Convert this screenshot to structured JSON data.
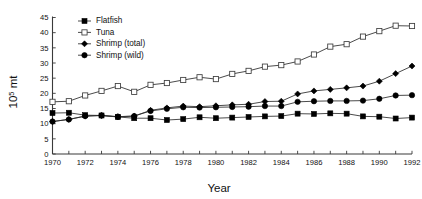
{
  "chart_data": {
    "type": "line",
    "title": "",
    "xlabel": "Year",
    "ylabel": "10^5 mt",
    "ylabel_base": "10",
    "ylabel_sup": "5",
    "ylabel_unit": " mt",
    "xlim": [
      1970,
      1992
    ],
    "ylim": [
      0,
      45
    ],
    "ytick_step": 5,
    "xtick_step": 1,
    "xtick_label_step": 2,
    "grid": false,
    "legend_position": "top-center",
    "x": [
      1970,
      1971,
      1972,
      1973,
      1974,
      1975,
      1976,
      1977,
      1978,
      1979,
      1980,
      1981,
      1982,
      1983,
      1984,
      1985,
      1986,
      1987,
      1988,
      1989,
      1990,
      1991,
      1992
    ],
    "xtick_labels": [
      "1970",
      "1972",
      "1974",
      "1976",
      "1978",
      "1980",
      "1982",
      "1984",
      "1986",
      "1988",
      "1990",
      "1992"
    ],
    "ytick_labels": [
      "0",
      "5",
      "10",
      "15",
      "20",
      "25",
      "30",
      "35",
      "40",
      "45"
    ],
    "series": [
      {
        "name": "Flatfish",
        "marker": "filled-square",
        "values": [
          13.5,
          13.6,
          12.8,
          12.7,
          12.2,
          11.8,
          11.8,
          11.2,
          11.5,
          12.1,
          11.8,
          12.0,
          12.2,
          12.4,
          12.5,
          13.3,
          13.2,
          13.4,
          13.3,
          12.4,
          12.3,
          11.7,
          12.0
        ]
      },
      {
        "name": "Tuna",
        "marker": "open-square",
        "values": [
          17.2,
          17.4,
          19.3,
          20.8,
          22.4,
          20.5,
          22.8,
          23.4,
          24.4,
          25.3,
          24.7,
          26.4,
          27.4,
          28.8,
          29.3,
          30.5,
          32.8,
          35.4,
          36.2,
          38.7,
          40.5,
          42.3,
          42.2
        ]
      },
      {
        "name": "Shrimp (total)",
        "marker": "filled-diamond",
        "values": [
          10.7,
          11.4,
          12.5,
          12.7,
          12.3,
          12.5,
          14.4,
          15.2,
          15.8,
          15.6,
          15.9,
          16.2,
          16.4,
          17.3,
          17.4,
          19.8,
          20.8,
          21.3,
          21.8,
          22.4,
          24.0,
          26.5,
          29.0
        ]
      },
      {
        "name": "Shrimp (wild)",
        "marker": "filled-circle",
        "values": [
          10.7,
          11.4,
          12.5,
          12.7,
          12.3,
          12.5,
          14.2,
          14.9,
          15.4,
          15.3,
          15.4,
          15.5,
          15.6,
          15.8,
          15.8,
          17.2,
          17.4,
          17.5,
          17.5,
          17.6,
          18.2,
          19.3,
          19.4
        ]
      }
    ],
    "legend": [
      {
        "label": "Flatfish",
        "marker": "filled-square"
      },
      {
        "label": "Tuna",
        "marker": "open-square"
      },
      {
        "label": "Shrimp (total)",
        "marker": "filled-diamond"
      },
      {
        "label": "Shrimp (wild)",
        "marker": "filled-circle"
      }
    ],
    "colors": {
      "series_line": "#2b2b2b",
      "marker_fill": "#000000",
      "marker_open_fill": "#ffffff",
      "axis": "#3a3a3a",
      "background": "#ffffff",
      "text": "#111111"
    }
  }
}
